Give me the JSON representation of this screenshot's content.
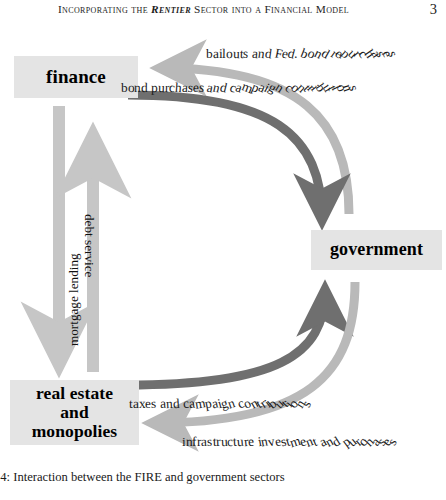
{
  "running_head": {
    "text_before": "Incorporating the ",
    "emphasis": "Rentier",
    "text_after": " Sector into a Financial Model",
    "page_number": "3"
  },
  "figure": {
    "nodes": [
      {
        "id": "finance",
        "label": "finance"
      },
      {
        "id": "government",
        "label": "government"
      },
      {
        "id": "real-estate-and-monopolies",
        "label_line1": "real estate",
        "label_line2": "and",
        "label_line3": "monopolies"
      }
    ],
    "edges": [
      {
        "id": "bailouts",
        "label": "bailouts and Fed. bond repurchases",
        "from": "government",
        "to": "finance",
        "color": "#b9b9b9",
        "tone": "light"
      },
      {
        "id": "bond-purchases",
        "label": "bond purchases and campaign contributions",
        "from": "finance",
        "to": "government",
        "color": "#6f6f6f",
        "tone": "dark"
      },
      {
        "id": "mortgage-lending",
        "label": "mortgage lending",
        "from": "finance",
        "to": "real-estate-and-monopolies",
        "color": "#c6c6c6",
        "tone": "light"
      },
      {
        "id": "debt-service",
        "label": "debt service",
        "from": "real-estate-and-monopolies",
        "to": "finance",
        "color": "#c6c6c6",
        "tone": "light"
      },
      {
        "id": "taxes",
        "label": "taxes and campaign contributions",
        "from": "real-estate-and-monopolies",
        "to": "government",
        "color": "#6f6f6f",
        "tone": "dark"
      },
      {
        "id": "infrastructure",
        "label": "infrastructure investment and purchases",
        "from": "government",
        "to": "real-estate-and-monopolies",
        "color": "#b9b9b9",
        "tone": "light"
      }
    ]
  },
  "caption": {
    "text": ", 4: Interaction between the FIRE and government sectors"
  }
}
